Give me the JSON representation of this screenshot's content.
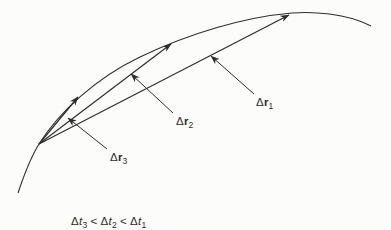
{
  "figure": {
    "colors": {
      "ink": "#2e2e2e",
      "paper": "#fcfcfa"
    },
    "vectors": [
      {
        "id": "dr1",
        "label": {
          "delta": "Δ",
          "symbol": "r",
          "subscript": "1"
        }
      },
      {
        "id": "dr2",
        "label": {
          "delta": "Δ",
          "symbol": "r",
          "subscript": "2"
        }
      },
      {
        "id": "dr3",
        "label": {
          "delta": "Δ",
          "symbol": "r",
          "subscript": "3"
        }
      }
    ],
    "caption": {
      "terms": [
        {
          "delta": "Δ",
          "symbol": "t",
          "subscript": "3"
        },
        {
          "delta": "Δ",
          "symbol": "t",
          "subscript": "2"
        },
        {
          "delta": "Δ",
          "symbol": "t",
          "subscript": "1"
        }
      ],
      "operators": [
        "<",
        "<"
      ]
    }
  }
}
